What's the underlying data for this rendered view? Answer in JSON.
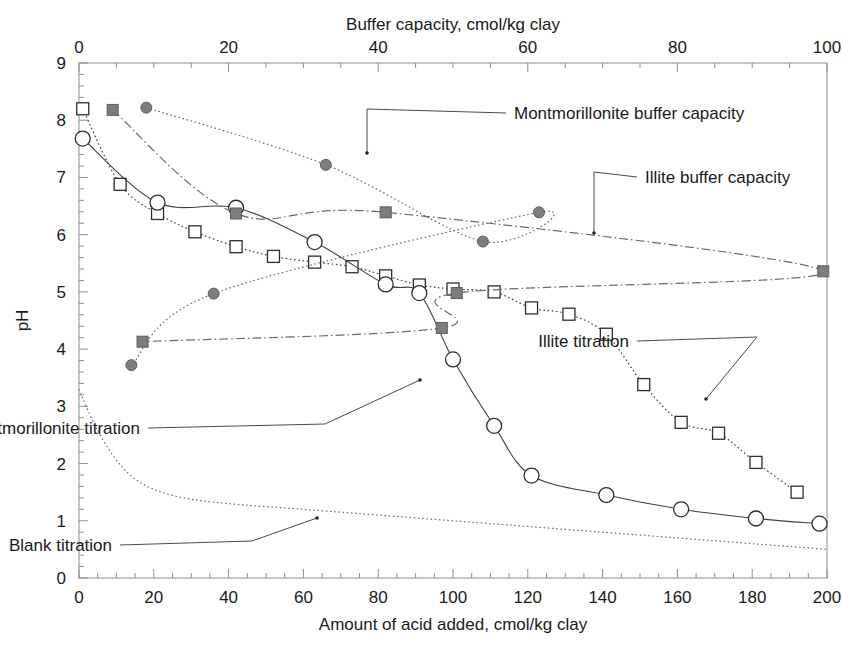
{
  "chart_data": {
    "type": "line",
    "title": "",
    "xlabel": "Amount of acid added, cmol/kg clay",
    "ylabel": "pH",
    "x2label": "Buffer capacity, cmol/kg clay",
    "xlim": [
      0,
      200
    ],
    "ylim": [
      0,
      9
    ],
    "x2lim": [
      0,
      100
    ],
    "xticks": [
      0,
      20,
      40,
      60,
      80,
      100,
      120,
      140,
      160,
      180,
      200
    ],
    "yticks": [
      0,
      1,
      2,
      3,
      4,
      5,
      6,
      7,
      8,
      9
    ],
    "x2ticks": [
      0,
      20,
      40,
      60,
      80,
      100
    ],
    "grid": false,
    "legend_position": "annotations-inline",
    "series": [
      {
        "name": "Illite titration",
        "marker": "open-square",
        "axis": "bottom",
        "color": "#404040",
        "linestyle": "dotted",
        "points": [
          [
            1,
            8.2
          ],
          [
            11,
            6.88
          ],
          [
            21,
            6.37
          ],
          [
            31,
            6.05
          ],
          [
            42,
            5.79
          ],
          [
            52,
            5.62
          ],
          [
            63,
            5.52
          ],
          [
            73,
            5.44
          ],
          [
            82,
            5.28
          ],
          [
            91,
            5.12
          ],
          [
            100,
            5.05
          ],
          [
            111,
            5.0
          ],
          [
            121,
            4.72
          ],
          [
            131,
            4.61
          ],
          [
            141,
            4.26
          ],
          [
            151,
            3.38
          ],
          [
            161,
            2.72
          ],
          [
            171,
            2.53
          ],
          [
            181,
            2.02
          ],
          [
            192,
            1.5
          ]
        ]
      },
      {
        "name": "Montmorillonite titration",
        "marker": "open-circle",
        "axis": "bottom",
        "color": "#404040",
        "linestyle": "solid",
        "points": [
          [
            1,
            7.68
          ],
          [
            21,
            6.56
          ],
          [
            42,
            6.47
          ],
          [
            63,
            5.87
          ],
          [
            82,
            5.13
          ],
          [
            91,
            4.98
          ],
          [
            100,
            3.82
          ],
          [
            111,
            2.66
          ],
          [
            121,
            1.79
          ],
          [
            141,
            1.45
          ],
          [
            161,
            1.2
          ],
          [
            181,
            1.04
          ],
          [
            198,
            0.95
          ]
        ]
      },
      {
        "name": "Montmorillonite buffer capacity",
        "marker": "filled-circle",
        "axis": "top",
        "color": "#6b6b6b",
        "linestyle": "dotted",
        "points": [
          [
            9.0,
            8.22
          ],
          [
            33.0,
            7.22
          ],
          [
            54.0,
            5.88
          ],
          [
            61.5,
            6.39
          ],
          [
            18.0,
            4.97
          ],
          [
            7.0,
            3.72
          ]
        ]
      },
      {
        "name": "Illite buffer capacity",
        "marker": "filled-square",
        "axis": "top",
        "color": "#6b6b6b",
        "linestyle": "dash-dot",
        "points": [
          [
            4.5,
            8.18
          ],
          [
            21.0,
            6.37
          ],
          [
            41.0,
            6.39
          ],
          [
            99.5,
            5.36
          ],
          [
            50.5,
            4.98
          ],
          [
            48.5,
            4.37
          ],
          [
            8.5,
            4.13
          ]
        ]
      },
      {
        "name": "Blank titration",
        "marker": "none",
        "axis": "bottom",
        "color": "#707070",
        "linestyle": "dotted",
        "points": [
          [
            0,
            3.3
          ],
          [
            4,
            2.7
          ],
          [
            9,
            2.15
          ],
          [
            14,
            1.78
          ],
          [
            20,
            1.55
          ],
          [
            28,
            1.4
          ],
          [
            40,
            1.3
          ],
          [
            60,
            1.2
          ],
          [
            80,
            1.1
          ],
          [
            100,
            1.0
          ],
          [
            120,
            0.9
          ],
          [
            140,
            0.8
          ],
          [
            160,
            0.7
          ],
          [
            180,
            0.6
          ],
          [
            200,
            0.5
          ]
        ]
      }
    ],
    "annotations": [
      {
        "id": "montmorillonite-buffer-capacity",
        "text": "Montmorillonite buffer capacity",
        "label_xy": [
          506,
          113
        ],
        "anchor_xy": [
          367,
          109
        ],
        "elbow_xy": [
          367,
          153
        ]
      },
      {
        "id": "illite-buffer-capacity",
        "text": "Illite buffer capacity",
        "label_xy": [
          637,
          177
        ],
        "anchor_xy": [
          594,
          172
        ],
        "elbow_xy": [
          594,
          233
        ]
      },
      {
        "id": "illite-titration",
        "text": "Illite titration",
        "label_xy": [
          637,
          341
        ],
        "anchor_xy": [
          757,
          337
        ],
        "elbow_xy": [
          706,
          399
        ]
      },
      {
        "id": "montmorillonite-titration",
        "text": "Montmorillonite titration",
        "label_xy": [
          148,
          428
        ],
        "anchor_xy": [
          325,
          424
        ],
        "elbow_xy": [
          420,
          380
        ]
      },
      {
        "id": "blank-titration",
        "text": "Blank titration",
        "label_xy": [
          120,
          545
        ],
        "anchor_xy": [
          252,
          541
        ],
        "elbow_xy": [
          317,
          518
        ]
      }
    ]
  }
}
